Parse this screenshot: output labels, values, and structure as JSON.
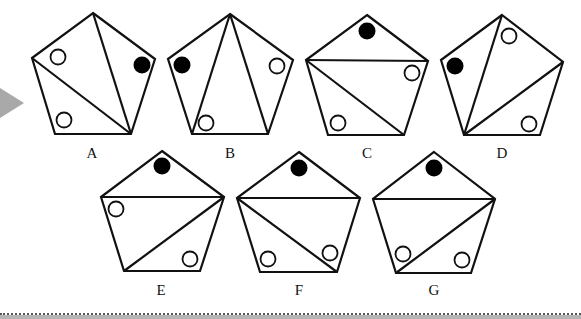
{
  "colors": {
    "stroke": "#111111",
    "filled_circle": "#000000",
    "open_circle_fill": "#ffffff",
    "pointer_arrow": "#a9a9a9",
    "footer_band": "#b5b5b5"
  },
  "pointer_arrow": {
    "points": [
      [
        0,
        88
      ],
      [
        24,
        103
      ],
      [
        0,
        118
      ]
    ]
  },
  "options": [
    {
      "label": "A",
      "label_pos": [
        92,
        146
      ],
      "vertices": [
        [
          93,
          13
        ],
        [
          155,
          59
        ],
        [
          131,
          134
        ],
        [
          55,
          134
        ],
        [
          32,
          58
        ]
      ],
      "diagonals": [
        [
          [
            131,
            134
          ],
          [
            93,
            13
          ]
        ],
        [
          [
            131,
            134
          ],
          [
            32,
            58
          ]
        ]
      ],
      "circles": [
        {
          "cx": 58,
          "cy": 57,
          "filled": false
        },
        {
          "cx": 142,
          "cy": 65,
          "filled": true
        },
        {
          "cx": 64,
          "cy": 120,
          "filled": false
        }
      ]
    },
    {
      "label": "B",
      "label_pos": [
        230,
        146
      ],
      "vertices": [
        [
          230,
          14
        ],
        [
          293,
          60
        ],
        [
          268,
          134
        ],
        [
          192,
          134
        ],
        [
          168,
          59
        ]
      ],
      "diagonals": [
        [
          [
            230,
            14
          ],
          [
            192,
            134
          ]
        ],
        [
          [
            230,
            14
          ],
          [
            268,
            134
          ]
        ]
      ],
      "circles": [
        {
          "cx": 182,
          "cy": 65,
          "filled": true
        },
        {
          "cx": 277,
          "cy": 66,
          "filled": false
        },
        {
          "cx": 206,
          "cy": 123,
          "filled": false
        }
      ]
    },
    {
      "label": "C",
      "label_pos": [
        367,
        146
      ],
      "vertices": [
        [
          367,
          15
        ],
        [
          428,
          61
        ],
        [
          404,
          135
        ],
        [
          328,
          135
        ],
        [
          306,
          60
        ]
      ],
      "diagonals": [
        [
          [
            306,
            60
          ],
          [
            428,
            61
          ]
        ],
        [
          [
            306,
            60
          ],
          [
            404,
            135
          ]
        ]
      ],
      "circles": [
        {
          "cx": 367,
          "cy": 31,
          "filled": true
        },
        {
          "cx": 412,
          "cy": 73,
          "filled": false
        },
        {
          "cx": 338,
          "cy": 123,
          "filled": false
        }
      ]
    },
    {
      "label": "D",
      "label_pos": [
        502,
        146
      ],
      "vertices": [
        [
          502,
          15
        ],
        [
          563,
          62
        ],
        [
          540,
          135
        ],
        [
          464,
          135
        ],
        [
          441,
          60
        ]
      ],
      "diagonals": [
        [
          [
            464,
            135
          ],
          [
            502,
            15
          ]
        ],
        [
          [
            464,
            135
          ],
          [
            563,
            62
          ]
        ]
      ],
      "circles": [
        {
          "cx": 455,
          "cy": 66,
          "filled": true
        },
        {
          "cx": 509,
          "cy": 36,
          "filled": false
        },
        {
          "cx": 529,
          "cy": 124,
          "filled": false
        }
      ]
    },
    {
      "label": "E",
      "label_pos": [
        161,
        283
      ],
      "vertices": [
        [
          162,
          151
        ],
        [
          224,
          197
        ],
        [
          200,
          271
        ],
        [
          124,
          271
        ],
        [
          101,
          197
        ]
      ],
      "diagonals": [
        [
          [
            101,
            197
          ],
          [
            224,
            197
          ]
        ],
        [
          [
            224,
            197
          ],
          [
            124,
            271
          ]
        ]
      ],
      "circles": [
        {
          "cx": 162,
          "cy": 166,
          "filled": true
        },
        {
          "cx": 116,
          "cy": 209,
          "filled": false
        },
        {
          "cx": 190,
          "cy": 259,
          "filled": false
        }
      ]
    },
    {
      "label": "F",
      "label_pos": [
        299,
        283
      ],
      "vertices": [
        [
          299,
          152
        ],
        [
          360,
          198
        ],
        [
          337,
          272
        ],
        [
          260,
          272
        ],
        [
          237,
          198
        ]
      ],
      "diagonals": [
        [
          [
            237,
            198
          ],
          [
            360,
            198
          ]
        ],
        [
          [
            237,
            198
          ],
          [
            337,
            272
          ]
        ]
      ],
      "circles": [
        {
          "cx": 299,
          "cy": 168,
          "filled": true
        },
        {
          "cx": 330,
          "cy": 253,
          "filled": false
        },
        {
          "cx": 268,
          "cy": 259,
          "filled": false
        }
      ]
    },
    {
      "label": "G",
      "label_pos": [
        434,
        283
      ],
      "vertices": [
        [
          434,
          152
        ],
        [
          495,
          199
        ],
        [
          471,
          273
        ],
        [
          396,
          273
        ],
        [
          373,
          199
        ]
      ],
      "diagonals": [
        [
          [
            373,
            199
          ],
          [
            495,
            199
          ]
        ],
        [
          [
            495,
            199
          ],
          [
            396,
            273
          ]
        ]
      ],
      "circles": [
        {
          "cx": 434,
          "cy": 168,
          "filled": true
        },
        {
          "cx": 403,
          "cy": 254,
          "filled": false
        },
        {
          "cx": 462,
          "cy": 260,
          "filled": false
        }
      ]
    }
  ]
}
